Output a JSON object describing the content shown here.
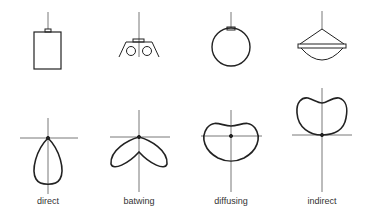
{
  "diagram": {
    "columns": [
      {
        "label": "direct",
        "luminaire": "cylinder-pendant"
      },
      {
        "label": "batwing",
        "luminaire": "louvered-twin-lamp-pendant"
      },
      {
        "label": "diffusing",
        "luminaire": "globe-pendant"
      },
      {
        "label": "indirect",
        "luminaire": "inverted-bowl-pendant"
      }
    ],
    "colors": {
      "stroke": "#222222",
      "axis": "#555555",
      "background": "#ffffff"
    }
  }
}
